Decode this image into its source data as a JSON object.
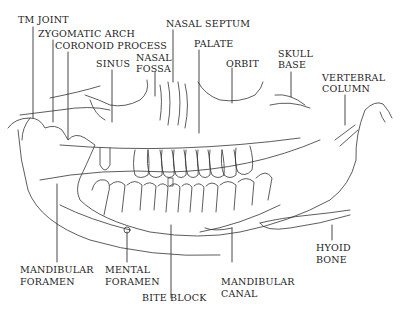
{
  "diagram": {
    "line_color": "#333333",
    "background": "#ffffff",
    "labels": {
      "tm_joint": "TM JOINT",
      "zygomatic_arch": "ZYGOMATIC ARCH",
      "coronoid_process": "CORONOID PROCESS",
      "sinus": "SINUS",
      "nasal_fossa_1": "NASAL",
      "nasal_fossa_2": "FOSSA",
      "nasal_septum": "NASAL SEPTUM",
      "palate": "PALATE",
      "orbit": "ORBIT",
      "skull_base_1": "SKULL",
      "skull_base_2": "BASE",
      "vertebral_column_1": "VERTEBRAL",
      "vertebral_column_2": "COLUMN",
      "mandibular_foramen_1": "MANDIBULAR",
      "mandibular_foramen_2": "FORAMEN",
      "mental_foramen_1": "MENTAL",
      "mental_foramen_2": "FORAMEN",
      "bite_block": "BITE BLOCK",
      "mandibular_canal_1": "MANDIBULAR",
      "mandibular_canal_2": "CANAL",
      "hyoid_bone_1": "HYOID",
      "hyoid_bone_2": "BONE"
    }
  }
}
